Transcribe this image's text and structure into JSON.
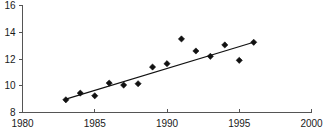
{
  "chart_data": {
    "type": "scatter",
    "title": "",
    "subtitle": "",
    "xlabel": "",
    "ylabel": "",
    "xlim": [
      1980,
      2000
    ],
    "ylim": [
      8,
      16
    ],
    "xticks": [
      1980,
      1985,
      1990,
      1995,
      2000
    ],
    "xtick_labels": [
      "1980",
      "1985",
      "1990",
      "1995",
      "2000"
    ],
    "yticks": [
      8,
      10,
      12,
      14,
      16
    ],
    "ytick_labels": [
      "8",
      "10",
      "12",
      "14",
      "16"
    ],
    "grid": false,
    "legend": false,
    "legend_position": "none",
    "x": [
      1983,
      1984,
      1985,
      1986,
      1987,
      1988,
      1989,
      1990,
      1991,
      1992,
      1993,
      1994,
      1995,
      1996
    ],
    "values": [
      8.95,
      9.45,
      9.25,
      10.2,
      10.05,
      10.15,
      11.4,
      11.65,
      13.5,
      12.6,
      12.2,
      13.05,
      11.9,
      13.25
    ],
    "series": [
      {
        "name": "observations",
        "type": "scatter",
        "marker": "diamond",
        "color": "#111111",
        "x": [
          1983,
          1984,
          1985,
          1986,
          1987,
          1988,
          1989,
          1990,
          1991,
          1992,
          1993,
          1994,
          1995,
          1996
        ],
        "values": [
          8.95,
          9.45,
          9.25,
          10.2,
          10.05,
          10.15,
          11.4,
          11.65,
          13.5,
          12.6,
          12.2,
          13.05,
          11.9,
          13.25
        ]
      },
      {
        "name": "trend-line",
        "type": "line",
        "color": "#111111",
        "x": [
          1983,
          1996
        ],
        "values": [
          9.0,
          13.25
        ]
      }
    ],
    "annotations": []
  },
  "axes": {
    "x_axis_name": "x-axis",
    "y_axis_name": "y-axis"
  }
}
